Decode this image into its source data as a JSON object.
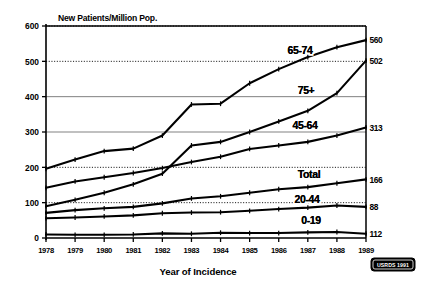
{
  "chart_data": {
    "type": "line",
    "title": "",
    "ylabel": "New Patients/Million Pop.",
    "xlabel": "Year of Incidence",
    "ylim": [
      0,
      600
    ],
    "yticks": [
      "0",
      "100",
      "200",
      "300",
      "400",
      "500",
      "600"
    ],
    "grid": "horizontal",
    "legend_position": "inline-labels",
    "categories": [
      "1978",
      "1979",
      "1980",
      "1981",
      "1982",
      "1983",
      "1984",
      "1985",
      "1986",
      "1987",
      "1988",
      "1989"
    ],
    "series": [
      {
        "name": "65-74",
        "label": "65-74",
        "end_label": "560",
        "values": [
          196,
          222,
          246,
          253,
          290,
          378,
          380,
          438,
          478,
          512,
          540,
          560
        ]
      },
      {
        "name": "75+",
        "label": "75+",
        "end_label": "502",
        "values": [
          90,
          108,
          128,
          152,
          182,
          262,
          272,
          300,
          330,
          360,
          410,
          502
        ]
      },
      {
        "name": "45-64",
        "label": "45-64",
        "end_label": "313",
        "values": [
          142,
          160,
          172,
          184,
          198,
          215,
          230,
          252,
          262,
          272,
          290,
          313
        ]
      },
      {
        "name": "Total",
        "label": "Total",
        "end_label": "166",
        "values": [
          71,
          79,
          84,
          88,
          98,
          112,
          118,
          128,
          138,
          144,
          155,
          166
        ]
      },
      {
        "name": "20-44",
        "label": "20-44",
        "end_label": "88",
        "values": [
          56,
          58,
          61,
          64,
          70,
          72,
          73,
          77,
          82,
          86,
          92,
          88
        ]
      },
      {
        "name": "0-19",
        "label": "0-19",
        "end_label": "112",
        "values": [
          10,
          9,
          9,
          10,
          13,
          12,
          15,
          14,
          14,
          16,
          17,
          12
        ]
      }
    ]
  },
  "source_badge": {
    "text": "USRDS 1991"
  }
}
